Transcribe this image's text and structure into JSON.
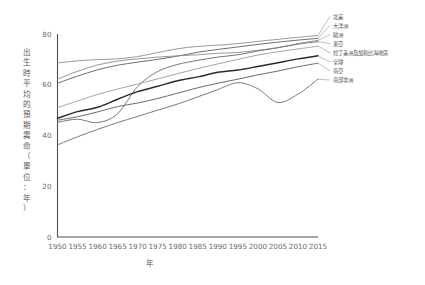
{
  "chart_data": {
    "type": "line",
    "title": "",
    "xlabel": "年",
    "ylabel": "出生時平均的預期壽命（單位：年）",
    "xlim": [
      1950,
      2015
    ],
    "ylim": [
      0,
      80
    ],
    "grid": false,
    "legend_position": "right-outside-labels",
    "x_ticks": [
      "1950",
      "1955",
      "1960",
      "1965",
      "1970",
      "1975",
      "1980",
      "1985",
      "1990",
      "1995",
      "2000",
      "2005",
      "2010",
      "2015"
    ],
    "y_ticks": [
      "0",
      "20",
      "40",
      "60",
      "80"
    ],
    "x": [
      1950,
      1955,
      1960,
      1965,
      1970,
      1975,
      1980,
      1985,
      1990,
      1995,
      2000,
      2005,
      2010,
      2015
    ],
    "series": [
      {
        "name": "北美",
        "color": "#8f8f8f",
        "width": 0.9,
        "values": [
          68.6,
          69.4,
          69.9,
          70.2,
          71.1,
          72.7,
          74.2,
          75.1,
          75.6,
          76.2,
          77.1,
          77.9,
          78.7,
          79.4
        ]
      },
      {
        "name": "大洋洲",
        "color": "#6e6e6e",
        "width": 1.0,
        "values": [
          60.6,
          63.4,
          65.9,
          67.7,
          68.9,
          70.0,
          71.3,
          72.8,
          73.9,
          74.9,
          75.9,
          76.8,
          77.6,
          78.3
        ]
      },
      {
        "name": "歐洲",
        "color": "#8a8a8a",
        "width": 0.9,
        "values": [
          62.2,
          65.3,
          67.8,
          69.3,
          70.2,
          70.9,
          71.4,
          71.8,
          72.4,
          72.7,
          73.6,
          74.6,
          76.2,
          77.5
        ]
      },
      {
        "name": "東亞",
        "color": "#787878",
        "width": 1.0,
        "values": [
          45.2,
          46.4,
          45.1,
          48.6,
          59.3,
          65.2,
          68.0,
          69.6,
          70.9,
          71.8,
          73.3,
          74.6,
          76.0,
          77.0
        ]
      },
      {
        "name": "拉丁美洲及加勒比海地區",
        "color": "#9a9a9a",
        "width": 0.9,
        "values": [
          51.0,
          53.6,
          56.2,
          58.3,
          60.3,
          62.3,
          64.4,
          66.4,
          68.2,
          70.0,
          71.7,
          73.0,
          74.1,
          75.2
        ]
      },
      {
        "name": "全球",
        "color": "#2b2b2b",
        "width": 1.5,
        "values": [
          46.8,
          49.4,
          51.1,
          54.3,
          57.3,
          59.4,
          61.6,
          63.1,
          64.9,
          65.8,
          67.2,
          68.7,
          70.2,
          71.4
        ]
      },
      {
        "name": "南亞",
        "color": "#6a6a6a",
        "width": 1.0,
        "values": [
          46.0,
          47.4,
          49.3,
          51.4,
          52.8,
          54.6,
          56.7,
          58.8,
          60.6,
          62.2,
          63.9,
          65.4,
          67.1,
          68.5
        ]
      },
      {
        "name": "南部非洲",
        "color": "#7a7a7a",
        "width": 1.0,
        "values": [
          36.3,
          39.5,
          42.4,
          45.1,
          47.5,
          50.0,
          52.4,
          55.2,
          58.1,
          60.8,
          58.4,
          53.0,
          56.3,
          62.2
        ]
      }
    ]
  },
  "legend": {
    "items": [
      {
        "label": "北美"
      },
      {
        "label": "大洋洲"
      },
      {
        "label": "歐洲"
      },
      {
        "label": "東亞"
      },
      {
        "label": "拉丁美洲及加勒比海地區"
      },
      {
        "label": "全球"
      },
      {
        "label": "南亞"
      },
      {
        "label": "南部非洲"
      }
    ]
  }
}
